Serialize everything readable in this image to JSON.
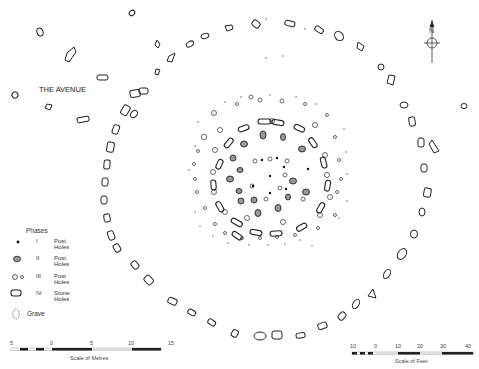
{
  "labels": {
    "avenue": "THE AVENUE",
    "north": "N"
  },
  "legend": {
    "title": "Phases",
    "items": [
      {
        "symbol": "filled-dot",
        "numeral": "I",
        "label": "Post Holes"
      },
      {
        "symbol": "shaded-oval",
        "numeral": "II",
        "label": "Post Holes"
      },
      {
        "symbol": "open-circles",
        "numeral": "III",
        "label": "Post Holes"
      },
      {
        "symbol": "stone-outline",
        "numeral": "IV",
        "label": "Stone Holes"
      },
      {
        "symbol": "dashed-oval",
        "numeral": "",
        "label": "Grave"
      }
    ]
  },
  "scale_metres": {
    "ticks": [
      "5",
      "0",
      "5",
      "10",
      "15"
    ],
    "label": "Scale of Metres"
  },
  "scale_feet": {
    "ticks": [
      "10",
      "0",
      "10",
      "20",
      "30",
      "40"
    ],
    "label": "Scale of Feet"
  }
}
